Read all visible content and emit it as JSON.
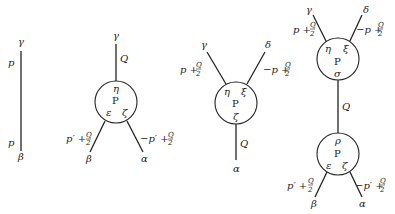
{
  "diagrams": {
    "propagator": {
      "top_label": "γ",
      "bottom_label": "β",
      "top_momentum": "p",
      "bottom_momentum": "p"
    },
    "vertex_one_to_two": {
      "top_label": "γ",
      "top_momentum": "Q",
      "blob": "P",
      "blob_top": "η",
      "blob_left": "ε",
      "blob_right": "ζ",
      "left_leg_label": "β",
      "right_leg_label": "α",
      "left_momentum_base": "p′ +",
      "right_momentum_base": "−p′ +",
      "frac_num": "Q",
      "frac_den": "2"
    },
    "vertex_two_to_one": {
      "left_leg_label": "γ",
      "right_leg_label": "δ",
      "left_momentum_base": "p +",
      "right_momentum_base": "−p +",
      "frac_num": "Q",
      "frac_den": "2",
      "blob": "P",
      "blob_left": "η",
      "blob_right": "ξ",
      "blob_bottom": "ζ",
      "bottom_momentum": "Q",
      "bottom_label": "α"
    },
    "two_vertex_chain": {
      "upper": {
        "left_leg_label": "γ",
        "right_leg_label": "δ",
        "left_momentum_base": "p +",
        "right_momentum_base": "−p +",
        "blob": "P",
        "blob_left": "η",
        "blob_right": "ξ",
        "blob_bottom": "σ"
      },
      "connector_momentum": "Q",
      "lower": {
        "blob": "P",
        "blob_top": "ρ",
        "blob_left": "ε",
        "blob_right": "ζ",
        "left_leg_label": "β",
        "right_leg_label": "α",
        "left_momentum_base": "p′ +",
        "right_momentum_base": "−p′ +"
      },
      "frac_num": "Q",
      "frac_den": "2"
    }
  }
}
